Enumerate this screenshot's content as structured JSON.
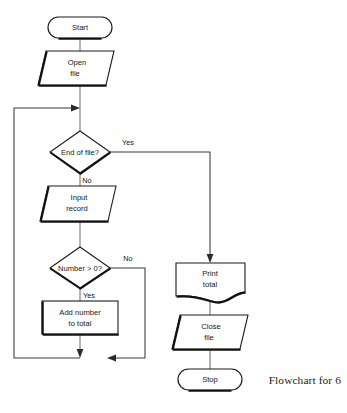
{
  "diagram": {
    "type": "flowchart",
    "caption": "Flowchart for 6",
    "nodes": [
      {
        "id": "start",
        "shape": "terminator",
        "label_line1": "Start",
        "label_line2": ""
      },
      {
        "id": "open_file",
        "shape": "parallelogram",
        "label_line1": "Open",
        "label_line2": "file"
      },
      {
        "id": "end_of_file",
        "shape": "diamond",
        "label_line1": "End of file?",
        "label_line2": ""
      },
      {
        "id": "input_record",
        "shape": "parallelogram",
        "label_line1": "Input",
        "label_line2": "record"
      },
      {
        "id": "number_gt_0",
        "shape": "diamond",
        "label_line1": "Number > 0?",
        "label_line2": ""
      },
      {
        "id": "add_number",
        "shape": "process",
        "label_line1": "Add number",
        "label_line2": "to total"
      },
      {
        "id": "print_total",
        "shape": "document",
        "label_line1": "Print",
        "label_line2": "total"
      },
      {
        "id": "close_file",
        "shape": "parallelogram",
        "label_line1": "Close",
        "label_line2": "file"
      },
      {
        "id": "stop",
        "shape": "terminator",
        "label_line1": "Stop",
        "label_line2": ""
      }
    ],
    "branch_labels": {
      "eof_yes": "Yes",
      "eof_no": "No",
      "number_no": "No",
      "number_yes": "Yes"
    },
    "colors": {
      "shape_stroke": "#1b1b1b",
      "connector_stroke": "#6e6e6e",
      "text": "#161616",
      "background": "#ffffff"
    }
  }
}
